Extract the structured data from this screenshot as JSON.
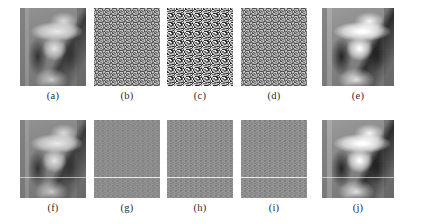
{
  "figure": {
    "name": "image-grid-figure",
    "rows": 2,
    "columns": 5,
    "background_color": "#ffffff",
    "caption_color": "#2b2b2b"
  },
  "panels": [
    {
      "id": "a",
      "caption": "(a)",
      "content": "lena-grayscale-portrait",
      "kind": "image",
      "row": "top",
      "column": 0,
      "noise_level": "none",
      "has_scanline": false
    },
    {
      "id": "b",
      "caption": "(b)",
      "content": "random-noise-field",
      "kind": "noise",
      "row": "top",
      "column": 1,
      "noise_level": "medium",
      "has_scanline": false
    },
    {
      "id": "c",
      "caption": "(c)",
      "content": "random-noise-field",
      "kind": "noise",
      "row": "top",
      "column": 2,
      "noise_level": "strong",
      "has_scanline": false
    },
    {
      "id": "d",
      "caption": "(d)",
      "content": "random-noise-field",
      "kind": "noise",
      "row": "top",
      "column": 3,
      "noise_level": "medium",
      "has_scanline": false
    },
    {
      "id": "e",
      "caption": "(e)",
      "content": "lena-grayscale-portrait",
      "kind": "image",
      "row": "top",
      "column": 4,
      "noise_level": "none",
      "has_scanline": false
    },
    {
      "id": "f",
      "caption": "(f)",
      "content": "lena-grayscale-portrait",
      "kind": "image",
      "row": "bottom",
      "column": 0,
      "noise_level": "none",
      "has_scanline": true
    },
    {
      "id": "g",
      "caption": "(g)",
      "content": "low-amplitude-noise-field",
      "kind": "noise",
      "row": "bottom",
      "column": 1,
      "noise_level": "weak",
      "has_scanline": true
    },
    {
      "id": "h",
      "caption": "(h)",
      "content": "low-amplitude-noise-field",
      "kind": "noise",
      "row": "bottom",
      "column": 2,
      "noise_level": "weak-plus",
      "has_scanline": true
    },
    {
      "id": "i",
      "caption": "(i)",
      "content": "low-amplitude-noise-field",
      "kind": "noise",
      "row": "bottom",
      "column": 3,
      "noise_level": "weak-plus",
      "has_scanline": true
    },
    {
      "id": "j",
      "caption": "(j)",
      "content": "lena-grayscale-portrait",
      "kind": "image",
      "row": "bottom",
      "column": 4,
      "noise_level": "none",
      "has_scanline": true
    }
  ]
}
